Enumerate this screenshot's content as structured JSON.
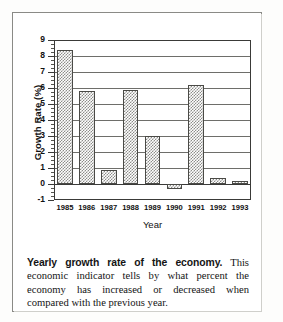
{
  "figure": {
    "caption_lead": "Yearly growth rate of the economy.",
    "caption_body": " This economic indicator tells by what percent the economy has increased or decreased when compared with the previous year."
  },
  "chart_data": {
    "type": "bar",
    "title": "",
    "xlabel": "Year",
    "ylabel": "Growth Rate (%)",
    "categories": [
      "1985",
      "1986",
      "1987",
      "1988",
      "1989",
      "1990",
      "1991",
      "1992",
      "1993"
    ],
    "values": [
      8.4,
      5.8,
      0.9,
      5.9,
      3.0,
      -0.3,
      6.2,
      0.4,
      0.2
    ],
    "ylim": [
      -1,
      9
    ],
    "ytick_labels": [
      "9",
      "8",
      "7",
      "6",
      "5",
      "4",
      "3",
      "2",
      "1",
      "0",
      "-1"
    ],
    "ytick_values": [
      9,
      8,
      7,
      6,
      5,
      4,
      3,
      2,
      1,
      0,
      -1
    ],
    "grid": true,
    "grid_axis": "y",
    "legend": "none",
    "bar_fill": "#8d8d8a",
    "bar_edge": "#4a4a46",
    "axis_color": "#3a3a38"
  }
}
